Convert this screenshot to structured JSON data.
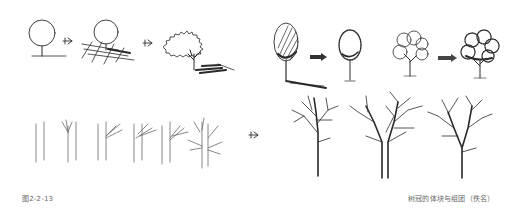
{
  "figure": {
    "label": "图2-2-13",
    "caption": "树冠的体块与组团（佚名）"
  },
  "sketches": {
    "row1": [
      {
        "name": "circle-canopy-basic"
      },
      {
        "name": "circle-canopy-with-ground-shadow"
      },
      {
        "name": "irregular-canopy-with-shadow"
      },
      {
        "name": "hatched-oval-canopy"
      },
      {
        "name": "textured-oval-canopy"
      },
      {
        "name": "clustered-outline-canopy"
      },
      {
        "name": "clustered-textured-canopy"
      }
    ],
    "row2": [
      {
        "name": "trunk-step-1"
      },
      {
        "name": "trunk-step-2"
      },
      {
        "name": "trunk-step-3"
      },
      {
        "name": "trunk-step-4"
      },
      {
        "name": "trunk-step-5"
      },
      {
        "name": "trunk-step-6"
      },
      {
        "name": "bare-tree-1"
      },
      {
        "name": "bare-tree-2"
      },
      {
        "name": "bare-tree-3"
      }
    ],
    "arrows": [
      "arrow-1",
      "arrow-2",
      "arrow-3",
      "arrow-4",
      "arrow-5"
    ]
  }
}
